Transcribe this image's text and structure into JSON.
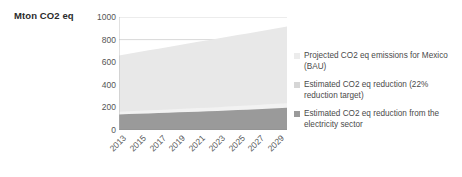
{
  "chart_data": {
    "type": "area",
    "stacked": true,
    "title": "",
    "ylabel": "Mton CO2 eq",
    "xlabel": "",
    "ylim": [
      0,
      1000
    ],
    "yticks": [
      0,
      200,
      400,
      600,
      800,
      1000
    ],
    "grid": true,
    "legend_position": "right",
    "x": [
      2013,
      2014,
      2015,
      2016,
      2017,
      2018,
      2019,
      2020,
      2021,
      2022,
      2023,
      2024,
      2025,
      2026,
      2027,
      2028,
      2029,
      2030
    ],
    "xtick_labels": [
      "2013",
      "2015",
      "2017",
      "2019",
      "2021",
      "2023",
      "2025",
      "2027",
      "2029"
    ],
    "series": [
      {
        "name": "Estimated CO2 eq  reduction from the electricity sector",
        "color": "#9a9a9a",
        "values": [
          138,
          141,
          144,
          147,
          150,
          153,
          156,
          159,
          162,
          165,
          168,
          172,
          176,
          180,
          184,
          188,
          192,
          196
        ]
      },
      {
        "name": "Estimated CO2 eq reduction (22% reduction target)",
        "color": "#f2f2f2",
        "values": [
          24,
          25,
          26,
          27,
          28,
          29,
          30,
          31,
          32,
          33,
          34,
          35,
          36,
          37,
          38,
          39,
          40,
          41
        ]
      },
      {
        "name": "Projected CO2 eq emissions for Mexico (BAU)",
        "color": "#e8e8e8",
        "values": [
          498,
          509,
          520,
          531,
          542,
          553,
          564,
          575,
          586,
          597,
          608,
          618,
          628,
          638,
          648,
          658,
          668,
          678
        ]
      }
    ],
    "totals": [
      660,
      675,
      690,
      705,
      720,
      735,
      750,
      765,
      780,
      795,
      810,
      825,
      840,
      855,
      870,
      885,
      900,
      915
    ],
    "annotations": []
  },
  "legend": {
    "items": [
      {
        "label": "Projected CO2 eq emissions for Mexico (BAU)",
        "color": "#ececec"
      },
      {
        "label": "Estimated CO2 eq reduction (22% reduction target)",
        "color": "#d6d6d6"
      },
      {
        "label": "Estimated CO2 eq  reduction from the electricity sector",
        "color": "#9a9a9a"
      }
    ]
  },
  "axes": {
    "y_title": "Mton CO2 eq",
    "y_ticks": [
      "1000",
      "800",
      "600",
      "400",
      "200",
      "0"
    ],
    "x_ticks": [
      "2013",
      "2015",
      "2017",
      "2019",
      "2021",
      "2023",
      "2025",
      "2027",
      "2029"
    ]
  }
}
